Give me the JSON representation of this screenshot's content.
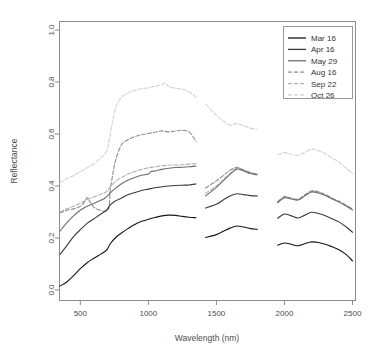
{
  "chart_data": {
    "type": "line",
    "title": "",
    "xlabel": "Wavelength (nm)",
    "ylabel": "Reflectance",
    "xlim": [
      350,
      2500
    ],
    "ylim": [
      0.0,
      1.0
    ],
    "grid": false,
    "legend_position": "top-right",
    "xticks": [
      500,
      1000,
      1500,
      2000,
      2500
    ],
    "xtick_labels": [
      "500",
      "1000",
      "1500",
      "2000",
      "2500"
    ],
    "yticks": [
      0.0,
      0.2,
      0.4,
      0.6,
      0.8,
      1.0
    ],
    "ytick_labels": [
      "0.0",
      "0.2",
      "0.4",
      "0.6",
      "0.8",
      "1.0"
    ],
    "gaps": [
      [
        1350,
        1420
      ],
      [
        1800,
        1950
      ]
    ],
    "series": [
      {
        "name": "Mar 16",
        "color": "#171717",
        "dash": "none",
        "linewidth": 1.1,
        "x": [
          350,
          400,
          450,
          500,
          550,
          600,
          650,
          680,
          700,
          720,
          760,
          800,
          850,
          900,
          950,
          1000,
          1050,
          1100,
          1150,
          1200,
          1250,
          1300,
          1350,
          1420,
          1500,
          1550,
          1600,
          1650,
          1700,
          1750,
          1800,
          1950,
          2000,
          2050,
          2100,
          2150,
          2200,
          2250,
          2300,
          2350,
          2400,
          2450,
          2500
        ],
        "y": [
          0.015,
          0.031,
          0.055,
          0.082,
          0.105,
          0.122,
          0.138,
          0.148,
          0.158,
          0.178,
          0.202,
          0.218,
          0.236,
          0.252,
          0.264,
          0.272,
          0.279,
          0.285,
          0.288,
          0.287,
          0.283,
          0.28,
          0.278,
          0.202,
          0.213,
          0.226,
          0.238,
          0.246,
          0.242,
          0.236,
          0.233,
          0.172,
          0.181,
          0.176,
          0.17,
          0.178,
          0.185,
          0.183,
          0.176,
          0.166,
          0.155,
          0.138,
          0.112
        ]
      },
      {
        "name": "Apr 16",
        "color": "#3b3b3b",
        "dash": "none",
        "linewidth": 1.1,
        "x": [
          350,
          400,
          450,
          500,
          550,
          600,
          650,
          680,
          700,
          720,
          760,
          800,
          850,
          900,
          950,
          1000,
          1050,
          1100,
          1150,
          1200,
          1250,
          1300,
          1350,
          1420,
          1500,
          1550,
          1600,
          1650,
          1700,
          1750,
          1800,
          1950,
          2000,
          2050,
          2100,
          2150,
          2200,
          2250,
          2300,
          2350,
          2400,
          2450,
          2500
        ],
        "y": [
          0.137,
          0.17,
          0.205,
          0.232,
          0.256,
          0.274,
          0.292,
          0.302,
          0.312,
          0.327,
          0.343,
          0.353,
          0.366,
          0.375,
          0.383,
          0.388,
          0.393,
          0.397,
          0.4,
          0.402,
          0.403,
          0.404,
          0.408,
          0.315,
          0.33,
          0.346,
          0.362,
          0.37,
          0.367,
          0.363,
          0.362,
          0.276,
          0.292,
          0.285,
          0.277,
          0.288,
          0.299,
          0.294,
          0.286,
          0.274,
          0.262,
          0.244,
          0.222
        ]
      },
      {
        "name": "May 29",
        "color": "#6d6d6d",
        "dash": "none",
        "linewidth": 1.1,
        "x": [
          350,
          400,
          450,
          500,
          550,
          600,
          650,
          680,
          700,
          710,
          720,
          740,
          760,
          800,
          850,
          900,
          950,
          1000,
          1020,
          1050,
          1100,
          1150,
          1200,
          1250,
          1300,
          1350,
          1420,
          1500,
          1550,
          1600,
          1650,
          1700,
          1750,
          1800,
          1950,
          2000,
          2050,
          2100,
          2150,
          2200,
          2250,
          2300,
          2350,
          2400,
          2450,
          2500
        ],
        "y": [
          0.226,
          0.258,
          0.285,
          0.307,
          0.322,
          0.333,
          0.345,
          0.353,
          0.362,
          0.368,
          0.374,
          0.383,
          0.392,
          0.408,
          0.422,
          0.433,
          0.441,
          0.446,
          0.456,
          0.458,
          0.464,
          0.468,
          0.471,
          0.472,
          0.474,
          0.477,
          0.362,
          0.395,
          0.42,
          0.445,
          0.465,
          0.458,
          0.448,
          0.443,
          0.336,
          0.355,
          0.35,
          0.346,
          0.362,
          0.377,
          0.373,
          0.363,
          0.35,
          0.338,
          0.324,
          0.308
        ]
      },
      {
        "name": "Aug 16",
        "color": "#8f8f8f",
        "dash": "4,2",
        "linewidth": 1.1,
        "x": [
          350,
          400,
          450,
          500,
          530,
          550,
          570,
          600,
          650,
          680,
          700,
          710,
          715,
          720,
          740,
          760,
          800,
          850,
          900,
          950,
          1000,
          1050,
          1100,
          1150,
          1200,
          1250,
          1300,
          1350,
          1420,
          1500,
          1550,
          1600,
          1650,
          1700,
          1750,
          1800,
          1950,
          2000,
          2050,
          2100,
          2150,
          2200,
          2250,
          2300,
          2350,
          2400,
          2450,
          2500
        ],
        "y": [
          0.296,
          0.306,
          0.312,
          0.322,
          0.338,
          0.356,
          0.34,
          0.318,
          0.306,
          0.302,
          0.306,
          0.316,
          0.34,
          0.382,
          0.45,
          0.5,
          0.556,
          0.578,
          0.59,
          0.597,
          0.602,
          0.607,
          0.612,
          0.608,
          0.612,
          0.614,
          0.608,
          0.572,
          0.392,
          0.42,
          0.44,
          0.46,
          0.472,
          0.462,
          0.452,
          0.446,
          0.338,
          0.358,
          0.352,
          0.348,
          0.365,
          0.38,
          0.376,
          0.366,
          0.352,
          0.34,
          0.326,
          0.31
        ]
      },
      {
        "name": "Sep 22",
        "color": "#b0b0b0",
        "dash": "4,2",
        "linewidth": 1.1,
        "x": [
          350,
          400,
          450,
          500,
          550,
          600,
          650,
          680,
          700,
          720,
          760,
          800,
          850,
          900,
          950,
          1000,
          1050,
          1100,
          1150,
          1200,
          1250,
          1300,
          1350,
          1420,
          1500,
          1550,
          1600,
          1650,
          1700,
          1750,
          1800,
          1950,
          2000,
          2050,
          2100,
          2150,
          2200,
          2250,
          2300,
          2350,
          2400,
          2450,
          2500
        ],
        "y": [
          0.3,
          0.312,
          0.322,
          0.334,
          0.348,
          0.358,
          0.368,
          0.374,
          0.382,
          0.398,
          0.418,
          0.432,
          0.446,
          0.456,
          0.464,
          0.47,
          0.474,
          0.478,
          0.48,
          0.481,
          0.482,
          0.484,
          0.486,
          0.372,
          0.4,
          0.425,
          0.448,
          0.468,
          0.46,
          0.45,
          0.444,
          0.34,
          0.36,
          0.354,
          0.35,
          0.366,
          0.382,
          0.378,
          0.368,
          0.354,
          0.342,
          0.328,
          0.312
        ]
      },
      {
        "name": "Oct 26",
        "color": "#d6d6d6",
        "dash": "4,2",
        "linewidth": 1.2,
        "x": [
          350,
          400,
          450,
          500,
          550,
          600,
          650,
          680,
          700,
          720,
          740,
          760,
          800,
          850,
          900,
          950,
          1000,
          1050,
          1100,
          1120,
          1150,
          1200,
          1250,
          1300,
          1350,
          1420,
          1500,
          1550,
          1600,
          1650,
          1700,
          1750,
          1800,
          1950,
          2000,
          2050,
          2100,
          2150,
          2200,
          2250,
          2300,
          2350,
          2400,
          2450,
          2500
        ],
        "y": [
          0.412,
          0.428,
          0.44,
          0.455,
          0.47,
          0.486,
          0.508,
          0.522,
          0.545,
          0.6,
          0.655,
          0.7,
          0.74,
          0.758,
          0.768,
          0.774,
          0.778,
          0.784,
          0.79,
          0.798,
          0.782,
          0.776,
          0.772,
          0.762,
          0.742,
          0.715,
          0.672,
          0.65,
          0.634,
          0.64,
          0.632,
          0.622,
          0.618,
          0.52,
          0.528,
          0.522,
          0.518,
          0.53,
          0.542,
          0.536,
          0.524,
          0.508,
          0.492,
          0.47,
          0.448
        ]
      }
    ]
  },
  "legend": {
    "entries": [
      {
        "label": "Mar 16"
      },
      {
        "label": "Apr 16"
      },
      {
        "label": "May 29"
      },
      {
        "label": "Aug 16"
      },
      {
        "label": "Sep 22"
      },
      {
        "label": "Oct 26"
      }
    ]
  },
  "axes": {
    "x_title": "Wavelength (nm)",
    "y_title": "Reflectance"
  }
}
